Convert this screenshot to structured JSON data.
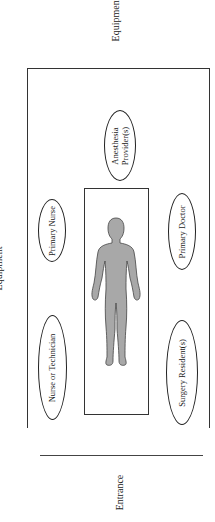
{
  "labels": {
    "equipment_top": "Equipment",
    "equipment_left": "Equipment",
    "entrance": "Entrance"
  },
  "roles": {
    "anesthesia": {
      "line1": "Anesthesia",
      "line2": "Provider(s)"
    },
    "primary_nurse": "Primary Nurse",
    "primary_doctor": "Primary Doctor",
    "nurse_or_technician": "Nurse or Technician",
    "surgery_resident": "Surgery Resident(s)"
  },
  "colors": {
    "line": "#333333",
    "figure_fill": "#a8a8a8",
    "figure_stroke": "#444444"
  }
}
